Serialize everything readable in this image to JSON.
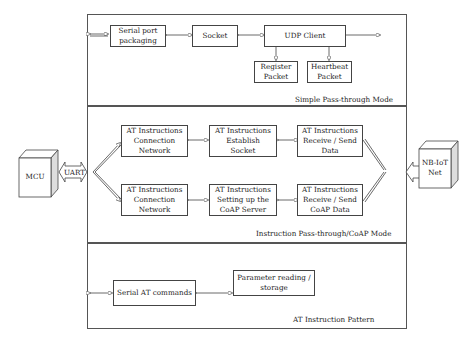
{
  "diagram": {
    "external": {
      "mcu": "MCU",
      "uart": "UART",
      "nbiot": "NB-IoT\nNet"
    },
    "sections": [
      {
        "mode_label": "Simple Pass-through Mode",
        "boxes": {
          "serial_port": "Serial port\npackaging",
          "socket": "Socket",
          "udp_client": "UDP Client",
          "register": "Register\nPacket",
          "heartbeat": "Heartbeat\nPacket"
        }
      },
      {
        "mode_label": "Instruction Pass-through/CoAP Mode",
        "boxes": {
          "conn_net_1": "AT Instructions\nConnection\nNetwork",
          "establish_socket": "AT Instructions\nEstablish\nSocket",
          "recv_send_data": "AT Instructions\nReceive / Send\nData",
          "conn_net_2": "AT Instructions\nConnection\nNetwork",
          "coap_server": "AT Instructions\nSetting up the\nCoAP Server",
          "recv_send_coap": "AT Instructions\nReceive / Send\nCoAP Data"
        }
      },
      {
        "mode_label": "AT Instruction Pattern",
        "boxes": {
          "serial_at": "Serial AT commands",
          "param_rw": "Parameter reading /\nstorage"
        }
      }
    ],
    "colors": {
      "line": "#444444",
      "background": "#ffffff"
    }
  }
}
